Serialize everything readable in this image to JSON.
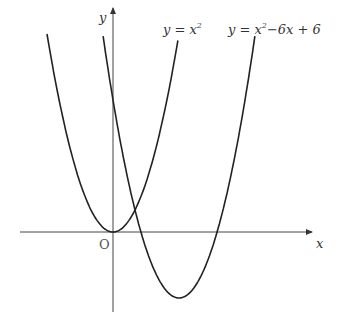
{
  "diagram": {
    "axes": {
      "x_label": "x",
      "y_label": "y",
      "origin_label": "O",
      "origin_px": [
        113,
        232
      ],
      "unit_px": 22,
      "x_range_px": [
        20,
        312
      ],
      "y_range_px": [
        8,
        312
      ]
    },
    "curves": [
      {
        "name": "parabola-1",
        "label_base": "y = x",
        "label_sup": "2",
        "label_rest": "",
        "a": 1,
        "b": 0,
        "c": 0,
        "x_from": -3.0,
        "x_to": 2.95,
        "label_px": [
          163,
          34
        ]
      },
      {
        "name": "parabola-2",
        "label_base": "y = x",
        "label_sup": "2",
        "label_rest": "−6x + 6",
        "a": 1,
        "b": -6,
        "c": 6,
        "x_from": -0.45,
        "x_to": 6.45,
        "label_px": [
          228,
          34
        ]
      }
    ],
    "stroke_color": "#222222"
  }
}
